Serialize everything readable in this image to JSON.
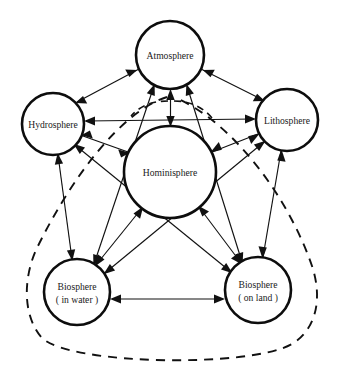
{
  "diagram": {
    "background_color": "#ffffff",
    "stroke_color": "#111111",
    "nodes": [
      {
        "id": "atmosphere",
        "label": "Atmosphere",
        "label2": "",
        "cx": 170,
        "cy": 55,
        "r": 34
      },
      {
        "id": "hydrosphere",
        "label": "Hydrosphere",
        "label2": "",
        "cx": 53,
        "cy": 124,
        "r": 31
      },
      {
        "id": "lithosphere",
        "label": "Lithosphere",
        "label2": "",
        "cx": 287,
        "cy": 120,
        "r": 31
      },
      {
        "id": "hominisphere",
        "label": "Hominisphere",
        "label2": "",
        "cx": 170,
        "cy": 172,
        "r": 46
      },
      {
        "id": "biosphere-water",
        "label": "Biosphere",
        "label2": "( in water )",
        "cx": 77,
        "cy": 292,
        "r": 33
      },
      {
        "id": "biosphere-land",
        "label": "Biosphere",
        "label2": "( on land )",
        "cx": 258,
        "cy": 290,
        "r": 33
      }
    ],
    "edges": [
      {
        "from": "hydrosphere",
        "to": "lithosphere",
        "style": "solid",
        "arrows": "both"
      },
      {
        "from": "atmosphere",
        "to": "hominisphere",
        "style": "solid",
        "arrows": "both"
      },
      {
        "from": "atmosphere",
        "to": "hydrosphere",
        "style": "solid",
        "arrows": "both"
      },
      {
        "from": "atmosphere",
        "to": "lithosphere",
        "style": "solid",
        "arrows": "both"
      },
      {
        "from": "atmosphere",
        "to": "biosphere-water",
        "style": "solid",
        "arrows": "both"
      },
      {
        "from": "atmosphere",
        "to": "biosphere-land",
        "style": "solid",
        "arrows": "both"
      },
      {
        "from": "hydrosphere",
        "to": "hominisphere",
        "style": "solid",
        "arrows": "both"
      },
      {
        "from": "lithosphere",
        "to": "hominisphere",
        "style": "solid",
        "arrows": "both"
      },
      {
        "from": "hydrosphere",
        "to": "biosphere-water",
        "style": "solid",
        "arrows": "both"
      },
      {
        "from": "lithosphere",
        "to": "biosphere-land",
        "style": "solid",
        "arrows": "both"
      },
      {
        "from": "hominisphere",
        "to": "biosphere-water",
        "style": "solid",
        "arrows": "both"
      },
      {
        "from": "hominisphere",
        "to": "biosphere-land",
        "style": "solid",
        "arrows": "both"
      },
      {
        "from": "hydrosphere",
        "to": "biosphere-land",
        "style": "solid",
        "arrows": "both"
      },
      {
        "from": "lithosphere",
        "to": "biosphere-water",
        "style": "solid",
        "arrows": "both"
      },
      {
        "from": "biosphere-water",
        "to": "biosphere-land",
        "style": "solid",
        "arrows": "both"
      }
    ],
    "dashed_boundary": {
      "name": "biosphere-enclosure",
      "description": "dashed outline enclosing both biosphere circles and extending up past hominisphere"
    }
  }
}
